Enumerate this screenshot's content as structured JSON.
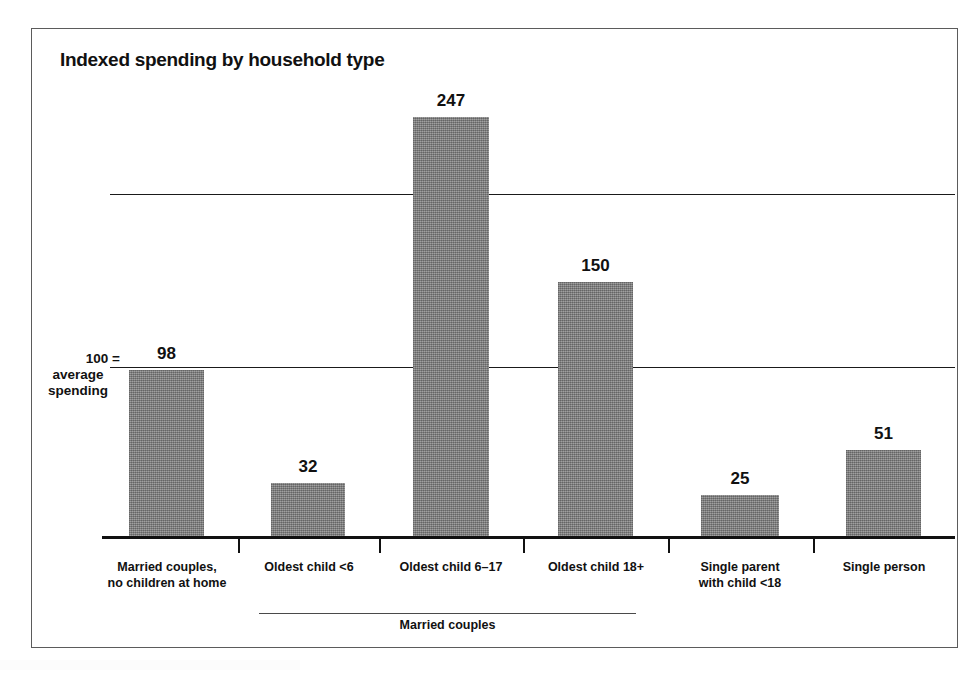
{
  "figure": {
    "title": "Indexed spending by household type",
    "axis_note_lines": [
      "100 =",
      "average",
      "spending"
    ],
    "group_bracket_label": "Married couples",
    "frame_color": "#5b5b5b",
    "bar_color": "#8a8a8a",
    "text_color": "#111111"
  },
  "chart_data": {
    "type": "bar",
    "title": "Indexed spending by household type",
    "xlabel": "",
    "ylabel": "100 = average spending",
    "ylim": [
      0,
      260
    ],
    "grid": true,
    "gridlines": [
      100,
      200
    ],
    "legend": "none",
    "categories": [
      "Married couples, no children at home",
      "Oldest child <6",
      "Oldest child 6–17",
      "Oldest child 18+",
      "Single parent with child <18",
      "Single person"
    ],
    "category_lines": [
      [
        "Married couples,",
        "no children at home"
      ],
      [
        "Oldest child <6"
      ],
      [
        "Oldest child 6–17"
      ],
      [
        "Oldest child 18+"
      ],
      [
        "Single parent",
        "with child <18"
      ],
      [
        "Single person"
      ]
    ],
    "values": [
      98,
      32,
      247,
      150,
      25,
      51
    ],
    "value_labels": [
      "98",
      "32",
      "247",
      "150",
      "25",
      "51"
    ],
    "groups": [
      {
        "label": "Married couples",
        "member_indices": [
          1,
          2,
          3
        ]
      }
    ],
    "annotations": [
      "100 = average spending"
    ]
  }
}
